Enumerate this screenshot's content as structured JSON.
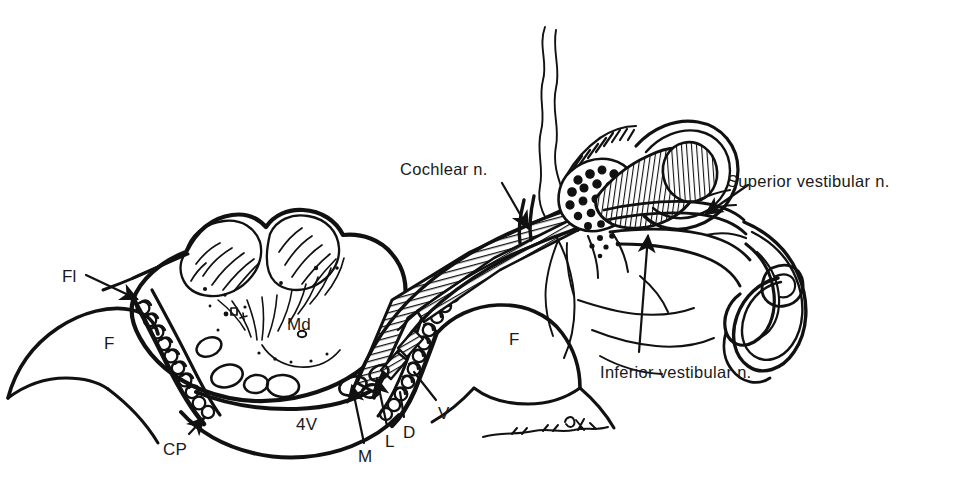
{
  "figure": {
    "style": "black-and-white line drawing, pen-and-ink anatomical illustration",
    "background_color": "#ffffff",
    "ink_color": "#111111"
  },
  "labels": {
    "cochlear": "Cochlear n.",
    "superior_vestibular": "Superior vestibular n.",
    "inferior_vestibular": "Inferior vestibular n.",
    "flocculus": "Fl",
    "choroid_plexus": "CP",
    "medulla": "Md",
    "fourth_ventricle": "4V",
    "flocculus_left": "F",
    "flocculus_right": "F",
    "medial_nucleus": "M",
    "lateral_nucleus": "L",
    "descending_nucleus": "D",
    "vestibular_nucleus": "V"
  },
  "label_positions": {
    "cochlear": {
      "x": 400,
      "y": 160
    },
    "superior_vestibular": {
      "x": 727,
      "y": 172
    },
    "inferior_vestibular": {
      "x": 600,
      "y": 363
    },
    "flocculus": {
      "x": 62,
      "y": 267
    },
    "choroid_plexus": {
      "x": 163,
      "y": 440
    },
    "medulla": {
      "x": 287,
      "y": 315
    },
    "fourth_ventricle": {
      "x": 296,
      "y": 415
    },
    "flocculus_left": {
      "x": 104,
      "y": 334
    },
    "flocculus_right": {
      "x": 509,
      "y": 330
    },
    "medial_nucleus": {
      "x": 358,
      "y": 447
    },
    "lateral_nucleus": {
      "x": 385,
      "y": 432
    },
    "descending_nucleus": {
      "x": 403,
      "y": 423
    },
    "vestibular_nucleus": {
      "x": 438,
      "y": 404
    }
  },
  "structures": [
    {
      "name": "medulla-cross-section",
      "description": "oval brainstem cross-section with bilobed dorsal surface, internal fiber striations and nuclei ovals"
    },
    {
      "name": "fourth-ventricle",
      "description": "open space inferior to the medulla labelled 4V"
    },
    {
      "name": "choroid-plexus-chain",
      "description": "beaded scalloped chain of choroid plexus villi flanking the medulla"
    },
    {
      "name": "flocculus-left",
      "description": "rounded cerebellar flocculus lobe at lower left"
    },
    {
      "name": "flocculus-right",
      "description": "rounded cerebellar flocculus lobe at lower right"
    },
    {
      "name": "cochlear-nerve-bundle",
      "description": "hatched striped nerve trunk ascending to the right"
    },
    {
      "name": "vestibular-nerve-bundle",
      "description": "hatched striped nerve trunk with superior and inferior divisions"
    },
    {
      "name": "vestibular-ganglion",
      "description": "stippled cellular mass of Scarpa's ganglion"
    },
    {
      "name": "cochlea-spiral",
      "description": "hatched spiral cochlear structure at upper right"
    },
    {
      "name": "semicircular-canals",
      "description": "elongated looping semicircular canal ducts at right"
    },
    {
      "name": "nerve-filaments",
      "description": "thin wavy arachnoid / nerve filaments rising from the top"
    },
    {
      "name": "artist-signature",
      "description": "small cursive signature squiggle at lower right"
    }
  ]
}
